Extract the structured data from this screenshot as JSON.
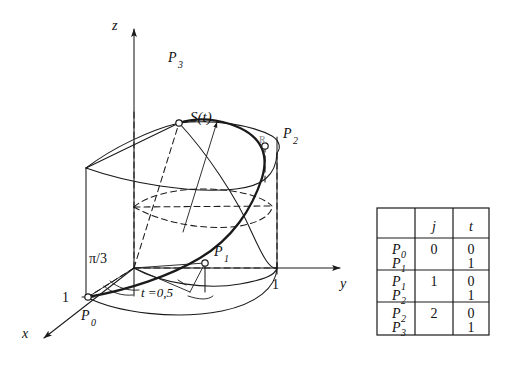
{
  "figure": {
    "kind": "3d-geometry-diagram",
    "background": "#ffffff",
    "ink": "#1a1a1a",
    "axes": {
      "x_label": "x",
      "y_label": "y",
      "z_label": "z"
    },
    "labels": {
      "p0": "P",
      "p0_sub": "0",
      "p1": "P",
      "p1_sub": "1",
      "p2": "P",
      "p2_sub": "2",
      "p3": "P",
      "p3_sub": "3",
      "curve": "S(t)",
      "angle": "π/3",
      "param_mid": "t =0,5",
      "tick_x": "1",
      "tick_y": "1",
      "radius": "R"
    }
  },
  "table": {
    "headers": [
      "",
      "j",
      "t"
    ],
    "rows": [
      {
        "points": [
          "P",
          "P"
        ],
        "point_subs": [
          "0",
          "1"
        ],
        "j": "0",
        "t": [
          "0",
          "1"
        ]
      },
      {
        "points": [
          "P",
          "P"
        ],
        "point_subs": [
          "1",
          "2"
        ],
        "j": "1",
        "t": [
          "0",
          "1"
        ]
      },
      {
        "points": [
          "P",
          "P"
        ],
        "point_subs": [
          "2",
          "3"
        ],
        "j": "2",
        "t": [
          "0",
          "1"
        ]
      }
    ]
  }
}
